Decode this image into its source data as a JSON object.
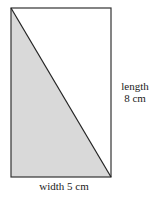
{
  "diagram": {
    "shape": "rectangle with diagonal",
    "shaded_region": "lower-left triangle",
    "colors": {
      "stroke": "#333333",
      "shade": "#d9d9d9",
      "background": "#ffffff"
    },
    "labels": {
      "length_line1": "length",
      "length_line2": "8 cm",
      "width": "width 5 cm"
    }
  }
}
